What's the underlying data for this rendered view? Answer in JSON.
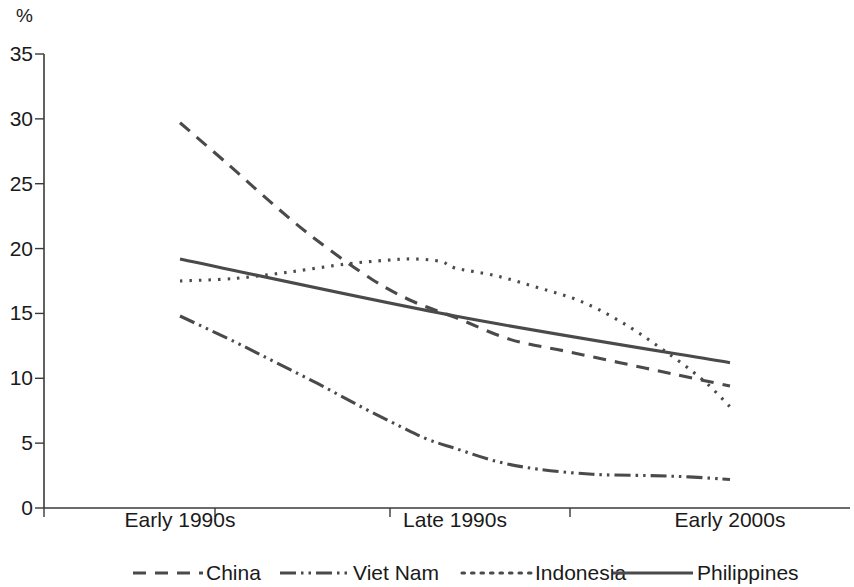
{
  "chart_data": {
    "type": "line",
    "title": "",
    "subtitle": "",
    "xlabel": "",
    "ylabel": "%",
    "unit_label": "%",
    "ylim": [
      0,
      35
    ],
    "y_ticks": [
      0,
      5,
      10,
      15,
      20,
      25,
      30,
      35
    ],
    "y_tick_labels": [
      "0",
      "5",
      "10",
      "15",
      "20",
      "25",
      "30",
      "35"
    ],
    "grid": false,
    "legend_position": "bottom",
    "categories": [
      "Early 1990s",
      "Late 1990s",
      "Early 2000s"
    ],
    "x": [
      0,
      1,
      2
    ],
    "series": [
      {
        "name": "China",
        "style": "dashed",
        "dasharray": "13,9",
        "color": "#4a4a4a",
        "values": [
          29.7,
          14.7,
          9.4
        ],
        "points": [
          [
            0.0,
            29.7
          ],
          [
            0.18,
            26.4
          ],
          [
            0.35,
            23.2
          ],
          [
            0.5,
            20.6
          ],
          [
            0.7,
            17.6
          ],
          [
            0.85,
            15.9
          ],
          [
            1.0,
            14.7
          ],
          [
            1.2,
            13.0
          ],
          [
            1.4,
            12.1
          ],
          [
            1.6,
            11.2
          ],
          [
            1.8,
            10.3
          ],
          [
            2.0,
            9.4
          ]
        ]
      },
      {
        "name": "Viet Nam",
        "style": "dash-dot-dot",
        "dasharray": "16,5,2.5,5,2.5,5",
        "color": "#4a4a4a",
        "values": [
          14.8,
          4.6,
          2.2
        ],
        "points": [
          [
            0.0,
            14.8
          ],
          [
            0.2,
            12.8
          ],
          [
            0.35,
            11.2
          ],
          [
            0.5,
            9.6
          ],
          [
            0.65,
            7.9
          ],
          [
            0.8,
            6.3
          ],
          [
            0.9,
            5.3
          ],
          [
            1.0,
            4.6
          ],
          [
            1.15,
            3.6
          ],
          [
            1.3,
            3.0
          ],
          [
            1.5,
            2.6
          ],
          [
            1.7,
            2.5
          ],
          [
            1.85,
            2.4
          ],
          [
            2.0,
            2.2
          ]
        ]
      },
      {
        "name": "Indonesia",
        "style": "dotted",
        "dasharray": "2.5,7",
        "color": "#4a4a4a",
        "values": [
          17.5,
          18.5,
          7.8
        ],
        "points": [
          [
            0.0,
            17.5
          ],
          [
            0.2,
            17.7
          ],
          [
            0.4,
            18.2
          ],
          [
            0.6,
            18.8
          ],
          [
            0.75,
            19.1
          ],
          [
            0.85,
            19.2
          ],
          [
            0.95,
            19.0
          ],
          [
            1.0,
            18.5
          ],
          [
            1.15,
            17.9
          ],
          [
            1.3,
            17.0
          ],
          [
            1.45,
            16.0
          ],
          [
            1.6,
            14.4
          ],
          [
            1.75,
            12.3
          ],
          [
            1.9,
            9.9
          ],
          [
            2.0,
            7.8
          ]
        ]
      },
      {
        "name": "Philippines",
        "style": "solid",
        "dasharray": "",
        "color": "#4a4a4a",
        "values": [
          19.2,
          14.8,
          11.2
        ],
        "points": [
          [
            0.0,
            19.2
          ],
          [
            1.0,
            14.8
          ],
          [
            2.0,
            11.2
          ]
        ]
      }
    ],
    "legend": [
      {
        "label": "China",
        "style": "dashed",
        "dasharray": "13,9"
      },
      {
        "label": "Viet Nam",
        "style": "dash-dot-dot",
        "dasharray": "16,5,2.5,5,2.5,5"
      },
      {
        "label": "Indonesia",
        "style": "dotted",
        "dasharray": "2.5,7"
      },
      {
        "label": "Philippines",
        "style": "solid",
        "dasharray": ""
      }
    ]
  },
  "geometry": {
    "plot_left": 44,
    "plot_right": 850,
    "plot_top": 54,
    "plot_bottom": 508,
    "data_left": 180,
    "data_right": 730,
    "x_tick_positions": [
      44,
      215,
      390,
      570
    ],
    "x_label_positions": [
      180,
      455,
      730
    ],
    "x_label_y": 527,
    "y_tick_label_x": 33,
    "unit_label_x": 33,
    "unit_label_y": 22,
    "legend_y": 573,
    "legend_items": [
      {
        "swatch_x1": 133,
        "swatch_x2": 203,
        "text_x": 206
      },
      {
        "swatch_x1": 280,
        "swatch_x2": 350,
        "text_x": 353
      },
      {
        "swatch_x1": 462,
        "swatch_x2": 532,
        "text_x": 535
      },
      {
        "swatch_x1": 613,
        "swatch_x2": 693,
        "text_x": 697
      }
    ]
  }
}
